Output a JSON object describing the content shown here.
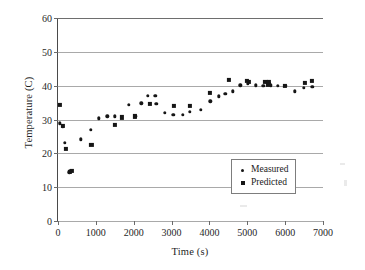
{
  "chart_data": {
    "type": "scatter",
    "title": "",
    "xlabel": "Time (s)",
    "ylabel": "Temperature (C)",
    "xlim": [
      0,
      7000
    ],
    "ylim": [
      0,
      60
    ],
    "xticks": [
      0,
      1000,
      2000,
      3000,
      4000,
      5000,
      6000,
      7000
    ],
    "yticks": [
      0,
      10,
      20,
      30,
      40,
      50,
      60
    ],
    "xtick_labels": [
      "0",
      "1000",
      "2000",
      "3000",
      "4000",
      "5000",
      "6000",
      "7000"
    ],
    "ytick_labels": [
      "0",
      "10",
      "20",
      "30",
      "40",
      "50",
      "60"
    ],
    "grid": "horizontal",
    "legend_position": "lower-right-inside",
    "marker_color": "#161616",
    "gridline_color": "#a9a9a9",
    "axis_color": "#4a4a4a",
    "series": [
      {
        "name": "Measured",
        "marker": "circle",
        "points": [
          [
            40,
            28.9
          ],
          [
            130,
            27.9
          ],
          [
            180,
            23.1
          ],
          [
            300,
            14.4
          ],
          [
            330,
            14.9
          ],
          [
            600,
            24.1
          ],
          [
            870,
            27.0
          ],
          [
            1080,
            30.4
          ],
          [
            1300,
            31.0
          ],
          [
            1500,
            31.0
          ],
          [
            1870,
            34.4
          ],
          [
            2040,
            30.9
          ],
          [
            2200,
            34.8
          ],
          [
            2380,
            37.0
          ],
          [
            2570,
            37.0
          ],
          [
            2600,
            34.6
          ],
          [
            2820,
            32.0
          ],
          [
            3050,
            31.3
          ],
          [
            3300,
            31.4
          ],
          [
            3480,
            32.3
          ],
          [
            3780,
            32.8
          ],
          [
            4020,
            35.4
          ],
          [
            4240,
            36.8
          ],
          [
            4420,
            37.6
          ],
          [
            4620,
            38.3
          ],
          [
            4820,
            40.1
          ],
          [
            5020,
            40.6
          ],
          [
            5220,
            40.1
          ],
          [
            5420,
            40.0
          ],
          [
            5620,
            40.1
          ],
          [
            5800,
            40.0
          ],
          [
            6000,
            40.0
          ],
          [
            6250,
            38.3
          ],
          [
            6500,
            39.4
          ],
          [
            6720,
            39.6
          ]
        ]
      },
      {
        "name": "Predicted",
        "marker": "square",
        "points": [
          [
            50,
            34.3
          ],
          [
            140,
            28.0
          ],
          [
            210,
            21.3
          ],
          [
            310,
            14.6
          ],
          [
            360,
            14.8
          ],
          [
            880,
            22.5
          ],
          [
            1500,
            28.4
          ],
          [
            1680,
            30.6
          ],
          [
            2040,
            30.9
          ],
          [
            2430,
            34.6
          ],
          [
            3060,
            33.9
          ],
          [
            3480,
            34.0
          ],
          [
            4010,
            37.8
          ],
          [
            4520,
            41.7
          ],
          [
            4980,
            41.3
          ],
          [
            5050,
            41.0
          ],
          [
            5480,
            41.0
          ],
          [
            5560,
            40.4
          ],
          [
            5580,
            41.1
          ],
          [
            6000,
            40.0
          ],
          [
            6520,
            40.9
          ],
          [
            6700,
            41.3
          ]
        ]
      }
    ]
  },
  "legend": {
    "entries": [
      {
        "label": "Measured",
        "marker": "circle"
      },
      {
        "label": "Predicted",
        "marker": "square"
      }
    ]
  }
}
